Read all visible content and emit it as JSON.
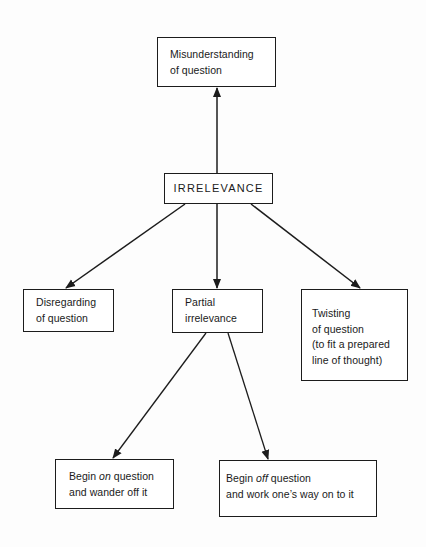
{
  "diagram": {
    "type": "hierarchy",
    "root": "irrelevance",
    "nodes": {
      "misunderstanding": {
        "lines": [
          "Misunderstanding",
          "of question"
        ]
      },
      "irrelevance": {
        "lines": [
          "IRRELEVANCE"
        ]
      },
      "disregarding": {
        "lines": [
          "Disregarding",
          "of question"
        ]
      },
      "partial": {
        "lines": [
          "Partial",
          "irrelevance"
        ]
      },
      "twisting": {
        "lines": [
          "Twisting",
          "of question",
          "(to fit a prepared",
          "line of thought)"
        ]
      },
      "begin_on": {
        "line1_prefix": "Begin ",
        "line1_emphasis": "on",
        "line1_suffix": " question",
        "line2": "and wander off it"
      },
      "begin_off": {
        "line1_prefix": "Begin ",
        "line1_emphasis": "off",
        "line1_suffix": " question",
        "line2": "and work one’s way on to it"
      }
    },
    "edges": [
      {
        "from": "irrelevance",
        "to": "misunderstanding",
        "arrow": "end"
      },
      {
        "from": "irrelevance",
        "to": "disregarding",
        "arrow": "end"
      },
      {
        "from": "irrelevance",
        "to": "partial",
        "arrow": "end"
      },
      {
        "from": "irrelevance",
        "to": "twisting",
        "arrow": "end"
      },
      {
        "from": "partial",
        "to": "begin_on",
        "arrow": "end"
      },
      {
        "from": "partial",
        "to": "begin_off",
        "arrow": "end"
      }
    ]
  },
  "colors": {
    "ink": "#1c1c1c",
    "background": "#ffffff"
  }
}
